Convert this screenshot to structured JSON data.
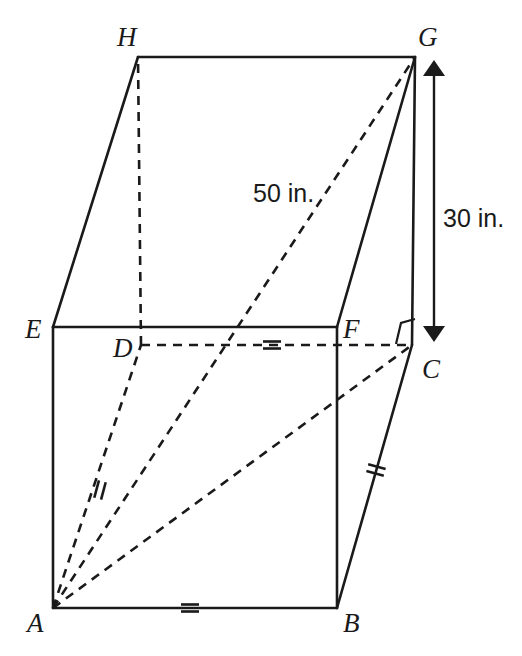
{
  "figure": {
    "vertices": [
      {
        "name": "H",
        "label": "H",
        "x": 138,
        "y": 57,
        "label_x": 117,
        "label_y": 46,
        "hidden": false
      },
      {
        "name": "G",
        "label": "G",
        "x": 415,
        "y": 57,
        "label_x": 418,
        "label_y": 46,
        "hidden": false
      },
      {
        "name": "E",
        "label": "E",
        "x": 53,
        "y": 327,
        "label_x": 25,
        "label_y": 338,
        "hidden": false
      },
      {
        "name": "F",
        "label": "F",
        "x": 337,
        "y": 327,
        "label_x": 343,
        "label_y": 338,
        "hidden": false
      },
      {
        "name": "D",
        "label": "D",
        "x": 141,
        "y": 345,
        "label_x": 113,
        "label_y": 357,
        "hidden": true
      },
      {
        "name": "C",
        "label": "C",
        "x": 412,
        "y": 345,
        "label_x": 422,
        "label_y": 378,
        "hidden": true
      },
      {
        "name": "A",
        "label": "A",
        "x": 53,
        "y": 608,
        "label_x": 27,
        "label_y": 632,
        "hidden": false
      },
      {
        "name": "B",
        "label": "B",
        "x": 337,
        "y": 608,
        "label_x": 343,
        "label_y": 632,
        "hidden": false
      }
    ],
    "solid_edges": [
      {
        "name": "edge-H-G",
        "from": "H",
        "to": "G"
      },
      {
        "name": "edge-E-H",
        "from": "E",
        "to": "H"
      },
      {
        "name": "edge-F-G",
        "from": "F",
        "to": "G"
      },
      {
        "name": "edge-E-F",
        "from": "E",
        "to": "F"
      },
      {
        "name": "edge-E-A",
        "from": "E",
        "to": "A"
      },
      {
        "name": "edge-F-B",
        "from": "F",
        "to": "B"
      },
      {
        "name": "edge-A-B",
        "from": "A",
        "to": "B"
      },
      {
        "name": "edge-B-C",
        "from": "B",
        "to": "C"
      },
      {
        "name": "edge-C-G",
        "from": "C",
        "to": "G"
      }
    ],
    "hidden_edges": [
      {
        "name": "edge-D-H",
        "from": "D",
        "to": "H"
      },
      {
        "name": "edge-D-C",
        "from": "D",
        "to": "C"
      },
      {
        "name": "edge-A-D",
        "from": "A",
        "to": "D"
      },
      {
        "name": "diagonal-A-G",
        "from": "A",
        "to": "G"
      },
      {
        "name": "diagonal-A-C",
        "from": "A",
        "to": "C"
      }
    ],
    "tick_marks": [
      {
        "name": "tick-edge-A-B",
        "x": 190,
        "y": 608,
        "angle": 90,
        "count": 2
      },
      {
        "name": "tick-edge-D-C",
        "x": 272,
        "y": 345,
        "angle": 90,
        "count": 2
      },
      {
        "name": "tick-edge-A-D",
        "x": 100,
        "y": 490,
        "angle": 15,
        "count": 2
      },
      {
        "name": "tick-edge-B-C",
        "x": 376,
        "y": 470,
        "angle": 105,
        "count": 2
      }
    ],
    "right_angle": {
      "name": "right-angle-marker-C",
      "x": 412,
      "y": 345
    },
    "dimensions": [
      {
        "name": "dimension-height",
        "label": "30 in.",
        "label_x": 443,
        "label_y": 227,
        "x1": 434,
        "y1": 60,
        "x2": 434,
        "y2": 342,
        "orientation": "vertical"
      },
      {
        "name": "dimension-diagonal",
        "label": "50 in.",
        "label_x": 253,
        "label_y": 202,
        "orientation": "diagonal"
      }
    ]
  }
}
